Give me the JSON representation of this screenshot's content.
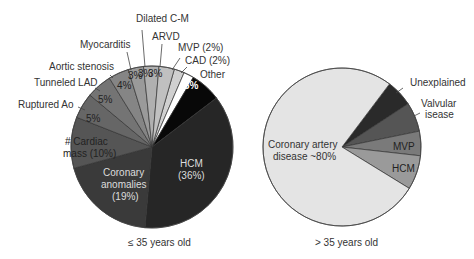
{
  "chart_data": [
    {
      "type": "pie",
      "title": "",
      "caption": "≤ 35 years old",
      "center": [
        152,
        147
      ],
      "radius": 81,
      "start_angle_deg": 16,
      "direction": "clockwise-from-top-order-reversed",
      "slices": [
        {
          "label": "MVP (2%)",
          "value": 2,
          "color": "#d0d0d0",
          "inner_text": "",
          "outer_label": "MVP (2%)"
        },
        {
          "label": "CAD (2%)",
          "value": 2,
          "color": "#ffffff",
          "inner_text": "",
          "outer_label": "CAD (2%)"
        },
        {
          "label": "Other",
          "value": 6,
          "color": "#080808",
          "inner_text": "6%",
          "outer_label": "Other"
        },
        {
          "label": "HCM",
          "value": 36,
          "color": "#262626",
          "inner_text": "HCM\n(36%)",
          "outer_label": ""
        },
        {
          "label": "Coronary anomalies",
          "value": 19,
          "color": "#3a3a3a",
          "inner_text": "Coronary\nanomalies\n(19%)",
          "outer_label": ""
        },
        {
          "label": "Cardiac mass",
          "value": 10,
          "color": "#555555",
          "inner_text": "# Cardiac\nmass (10%)",
          "outer_label": ""
        },
        {
          "label": "Ruptured Ao",
          "value": 5,
          "color": "#666666",
          "inner_text": "5%",
          "outer_label": "Ruptured Ao"
        },
        {
          "label": "Tunneled LAD",
          "value": 5,
          "color": "#747474",
          "inner_text": "5%",
          "outer_label": "Tunneled LAD"
        },
        {
          "label": "Aortic stenosis",
          "value": 4,
          "color": "#858585",
          "inner_text": "4%",
          "outer_label": "Aortic stenosis"
        },
        {
          "label": "Myocarditis",
          "value": 3,
          "color": "#9a9a9a",
          "inner_text": "3%",
          "outer_label": "Myocarditis"
        },
        {
          "label": "Dilated C-M",
          "value": 3,
          "color": "#b0b0b0",
          "inner_text": "3%",
          "outer_label": "Dilated C-M"
        },
        {
          "label": "ARVD",
          "value": 3,
          "color": "#c0c0c0",
          "inner_text": "3%",
          "outer_label": "ARVD"
        }
      ]
    },
    {
      "type": "pie",
      "title": "",
      "caption": "> 35 years old",
      "center": [
        342,
        147
      ],
      "radius": 79,
      "slices": [
        {
          "label": "Unexplained",
          "value": 5.5,
          "color": "#2a2a2a",
          "inner_text": "",
          "outer_label": "Unexplained"
        },
        {
          "label": "Valvular disease",
          "value": 6,
          "color": "#555555",
          "inner_text": "",
          "outer_label": "Valvular\nisease"
        },
        {
          "label": "MVP",
          "value": 5,
          "color": "#7a7a7a",
          "inner_text": "MVP",
          "outer_label": ""
        },
        {
          "label": "HCM",
          "value": 7,
          "color": "#9a9a9a",
          "inner_text": "HCM",
          "outer_label": ""
        },
        {
          "label": "Coronary artery disease",
          "value": 76.5,
          "color": "#e4e4e4",
          "inner_text": "Coronary artery\ndisease ~80%",
          "outer_label": ""
        }
      ]
    }
  ],
  "left": {
    "caption": "≤ 35 years old",
    "labels": {
      "dilated": "Dilated C-M",
      "arvd": "ARVD",
      "myocarditis": "Myocarditis",
      "mvp": "MVP (2%)",
      "cad": "CAD (2%)",
      "aortic": "Aortic stenosis",
      "other": "Other",
      "tunneled": "Tunneled LAD",
      "ruptured": "Ruptured Ao",
      "pct_other": "6%",
      "pct_4": "4%",
      "pct_3a": "3%",
      "pct_3b": "3%",
      "pct_3c": "3%",
      "pct_5a": "5%",
      "pct_5b": "5%",
      "cardiac_1": "# Cardiac",
      "cardiac_2": "mass (10%)",
      "coronary_1": "Coronary",
      "coronary_2": "anomalies",
      "coronary_3": "(19%)",
      "hcm_1": "HCM",
      "hcm_2": "(36%)"
    }
  },
  "right": {
    "caption": "> 35 years old",
    "labels": {
      "unexplained": "Unexplained",
      "valvular_1": "Valvular",
      "valvular_2": "isease",
      "mvp": "MVP",
      "hcm": "HCM",
      "cad_1": "Coronary artery",
      "cad_2": "disease  ~80%"
    }
  }
}
